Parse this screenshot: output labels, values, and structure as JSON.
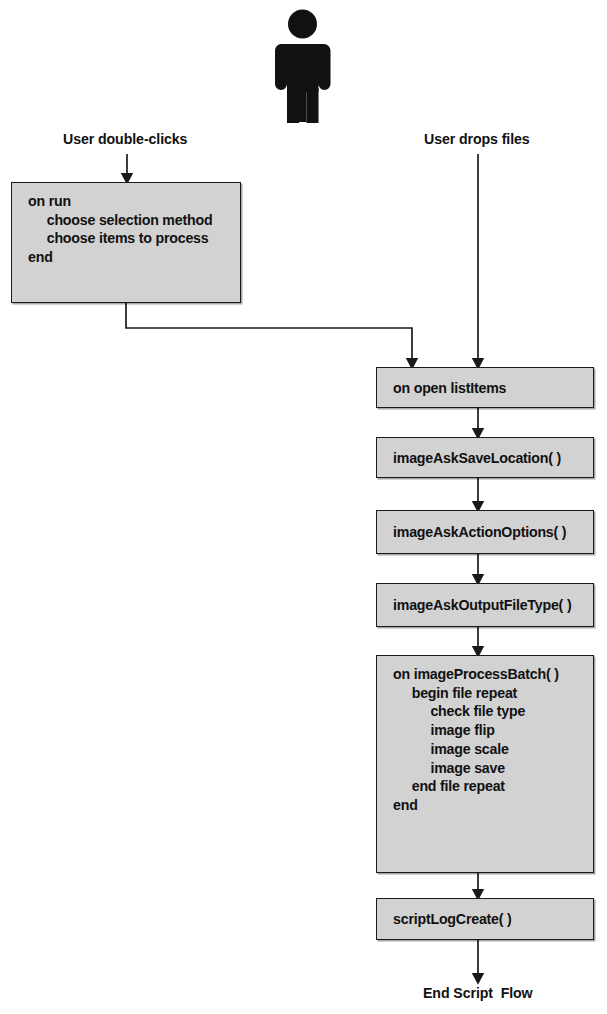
{
  "diagram": {
    "title": "Script Flow",
    "actor_icon": "person-icon",
    "colors": {
      "box_fill": "#d2d2d2",
      "box_stroke": "#1a1a1a",
      "text": "#111111",
      "background": "#ffffff"
    },
    "entry_labels": [
      {
        "id": "double-clicks",
        "text": "User double-clicks"
      },
      {
        "id": "drops-files",
        "text": "User drops files"
      }
    ],
    "boxes": [
      {
        "id": "on-run",
        "lines": "on run\n     choose selection method\n     choose items to process\nend"
      },
      {
        "id": "on-open",
        "lines": "on open listItems"
      },
      {
        "id": "save-loc",
        "lines": "imageAskSaveLocation( )"
      },
      {
        "id": "action-opts",
        "lines": "imageAskActionOptions( )"
      },
      {
        "id": "output-type",
        "lines": "imageAskOutputFileType( )"
      },
      {
        "id": "proc-batch",
        "lines": "on imageProcessBatch( )\n     begin file repeat\n          check file type\n          image flip\n          image scale\n          image save\n     end file repeat\nend"
      },
      {
        "id": "script-log",
        "lines": "scriptLogCreate( )"
      }
    ],
    "terminator": {
      "id": "end-flow",
      "text": "End Script  Flow"
    },
    "connectors": [
      {
        "from": "double-clicks-label",
        "to": "on-run",
        "type": "arrow-down"
      },
      {
        "from": "drops-files-label",
        "to": "on-open",
        "type": "arrow-down"
      },
      {
        "from": "on-run",
        "to": "on-open",
        "type": "elbow-right-down-arrow"
      },
      {
        "from": "on-open",
        "to": "save-loc",
        "type": "arrow-down"
      },
      {
        "from": "save-loc",
        "to": "action-opts",
        "type": "arrow-down"
      },
      {
        "from": "action-opts",
        "to": "output-type",
        "type": "arrow-down"
      },
      {
        "from": "output-type",
        "to": "proc-batch",
        "type": "arrow-down"
      },
      {
        "from": "proc-batch",
        "to": "script-log",
        "type": "arrow-down"
      },
      {
        "from": "script-log",
        "to": "end-flow",
        "type": "arrow-down"
      }
    ]
  }
}
